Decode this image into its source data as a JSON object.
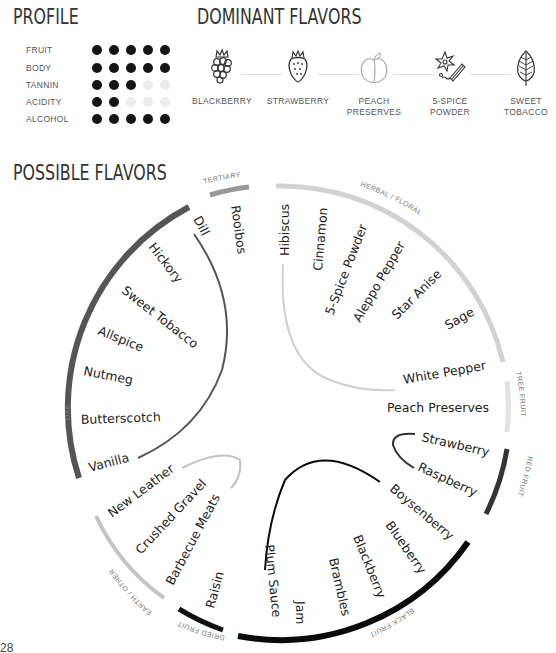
{
  "profile": {
    "title": "PROFILE",
    "rows": [
      {
        "label": "FRUIT",
        "value": 5,
        "max": 5
      },
      {
        "label": "BODY",
        "value": 5,
        "max": 5
      },
      {
        "label": "TANNIN",
        "value": 3,
        "max": 5
      },
      {
        "label": "ACIDITY",
        "value": 2,
        "max": 5
      },
      {
        "label": "ALCOHOL",
        "value": 5,
        "max": 5
      }
    ]
  },
  "dominant": {
    "title": "DOMINANT FLAVORS",
    "items": [
      {
        "label": "BLACKBERRY",
        "icon": "blackberry-icon"
      },
      {
        "label": "STRAWBERRY",
        "icon": "strawberry-icon"
      },
      {
        "label": "PEACH\nPRESERVES",
        "icon": "peach-icon"
      },
      {
        "label": "5-SPICE\nPOWDER",
        "icon": "spice-icon"
      },
      {
        "label": "SWEET\nTOBACCO",
        "icon": "leaf-icon"
      }
    ]
  },
  "possible": {
    "title": "POSSIBLE FLAVORS",
    "categories": [
      {
        "name": "OAK",
        "color": "#555555",
        "flavors": [
          "Dill",
          "Hickory",
          "Sweet Tobacco",
          "Allspice",
          "Nutmeg",
          "Butterscotch",
          "Vanilla"
        ]
      },
      {
        "name": "TERTIARY",
        "color": "#999999",
        "flavors": [
          "Rooibos"
        ]
      },
      {
        "name": "HERBAL / FLORAL",
        "color": "#d0d0d0",
        "flavors": [
          "Hibiscus",
          "Cinnamon",
          "5-Spice Powder",
          "Aleppo Pepper",
          "Star Anise",
          "Sage",
          "White Pepper"
        ]
      },
      {
        "name": "TREE FRUIT",
        "color": "#e0e0e0",
        "flavors": [
          "Peach Preserves"
        ]
      },
      {
        "name": "RED FRUIT",
        "color": "#333333",
        "flavors": [
          "Strawberry",
          "Raspberry"
        ]
      },
      {
        "name": "BLACK FRUIT",
        "color": "#0a0a0a",
        "flavors": [
          "Boysenberry",
          "Blueberry",
          "Blackberry",
          "Brambles",
          "Jam",
          "Plum Sauce"
        ]
      },
      {
        "name": "DRIED FRUIT",
        "color": "#111111",
        "flavors": [
          "Raisin"
        ]
      },
      {
        "name": "EARTH / OTHER",
        "color": "#c4c4c4",
        "flavors": [
          "New Leather",
          "Crushed Gravel",
          "Barbecue Meats"
        ]
      }
    ]
  },
  "page_number": "28"
}
